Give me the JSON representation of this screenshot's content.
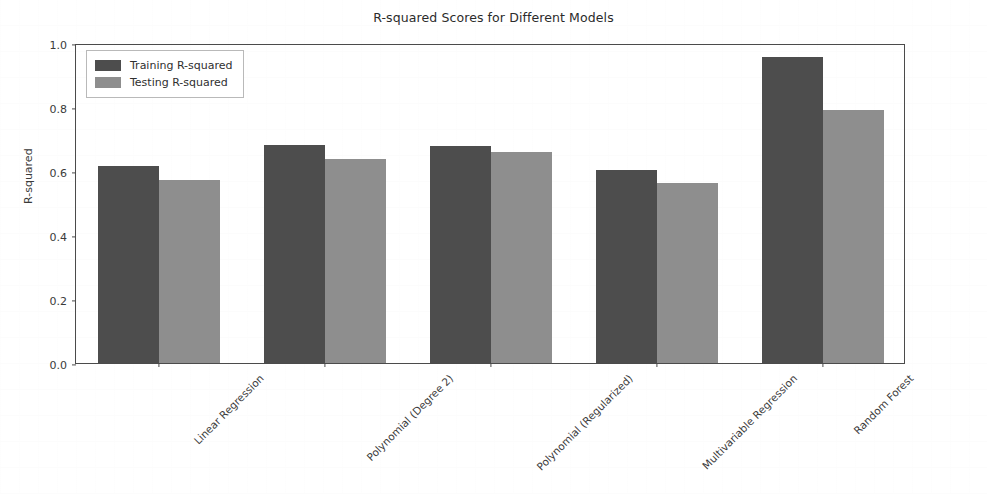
{
  "chart_data": {
    "type": "bar",
    "title": "R-squared Scores for Different Models",
    "xlabel": "",
    "ylabel": "R-squared",
    "categories": [
      "Linear Regression",
      "Polynomial (Degree 2)",
      "Polynomial (Regularized)",
      "Multivariable Regression",
      "Random Forest"
    ],
    "series": [
      {
        "name": "Training R-squared",
        "color": "#4d4d4d",
        "values": [
          0.615,
          0.68,
          0.678,
          0.602,
          0.955
        ]
      },
      {
        "name": "Testing R-squared",
        "color": "#8e8e8e",
        "values": [
          0.572,
          0.638,
          0.66,
          0.563,
          0.79
        ]
      }
    ],
    "ylim": [
      0.0,
      1.0
    ],
    "ytick_labels": [
      "0.0",
      "0.2",
      "0.4",
      "0.6",
      "0.8",
      "1.0"
    ],
    "ytick_values": [
      0.0,
      0.2,
      0.4,
      0.6,
      0.8,
      1.0
    ],
    "grid": false,
    "legend_position": "upper left",
    "xtick_label_rotation": -45
  }
}
